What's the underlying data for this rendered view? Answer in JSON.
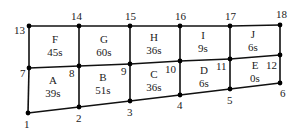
{
  "diagram": {
    "type": "mesh",
    "nodes": [
      {
        "id": "1",
        "x": 28,
        "y": 113,
        "lx": 24,
        "ly": 128
      },
      {
        "id": "2",
        "x": 79,
        "y": 107,
        "lx": 76,
        "ly": 122
      },
      {
        "id": "3",
        "x": 130,
        "y": 101,
        "lx": 127,
        "ly": 116
      },
      {
        "id": "4",
        "x": 180,
        "y": 95,
        "lx": 177,
        "ly": 109
      },
      {
        "id": "5",
        "x": 230,
        "y": 89,
        "lx": 227,
        "ly": 104
      },
      {
        "id": "6",
        "x": 280,
        "y": 83,
        "lx": 280,
        "ly": 97
      },
      {
        "id": "7",
        "x": 29,
        "y": 68,
        "lx": 20,
        "ly": 77
      },
      {
        "id": "8",
        "x": 79,
        "y": 66,
        "lx": 69,
        "ly": 77
      },
      {
        "id": "9",
        "x": 130,
        "y": 64,
        "lx": 121,
        "ly": 75
      },
      {
        "id": "10",
        "x": 180,
        "y": 61,
        "lx": 165,
        "ly": 73
      },
      {
        "id": "11",
        "x": 230,
        "y": 59,
        "lx": 216,
        "ly": 70
      },
      {
        "id": "12",
        "x": 280,
        "y": 55,
        "lx": 266,
        "ly": 69
      },
      {
        "id": "13",
        "x": 29,
        "y": 26,
        "lx": 14,
        "ly": 34
      },
      {
        "id": "14",
        "x": 79,
        "y": 26,
        "lx": 71,
        "ly": 20
      },
      {
        "id": "15",
        "x": 130,
        "y": 26,
        "lx": 125,
        "ly": 20
      },
      {
        "id": "16",
        "x": 180,
        "y": 26,
        "lx": 175,
        "ly": 20
      },
      {
        "id": "17",
        "x": 230,
        "y": 26,
        "lx": 225,
        "ly": 20
      },
      {
        "id": "18",
        "x": 280,
        "y": 25,
        "lx": 276,
        "ly": 18
      }
    ],
    "regions": [
      {
        "name": "A",
        "value": "39s",
        "cx": 53,
        "cy": 86
      },
      {
        "name": "B",
        "value": "51s",
        "cx": 103,
        "cy": 83
      },
      {
        "name": "C",
        "value": "36s",
        "cx": 154,
        "cy": 80
      },
      {
        "name": "D",
        "value": "6s",
        "cx": 204,
        "cy": 76
      },
      {
        "name": "E",
        "value": "0s",
        "cx": 255,
        "cy": 71
      },
      {
        "name": "F",
        "value": "45s",
        "cx": 55,
        "cy": 45
      },
      {
        "name": "G",
        "value": "60s",
        "cx": 104,
        "cy": 45
      },
      {
        "name": "H",
        "value": "36s",
        "cx": 154,
        "cy": 43
      },
      {
        "name": "I",
        "value": "9s",
        "cx": 203,
        "cy": 41
      },
      {
        "name": "J",
        "value": "6s",
        "cx": 253,
        "cy": 40
      }
    ],
    "edges": [
      [
        "1",
        "2"
      ],
      [
        "2",
        "3"
      ],
      [
        "3",
        "4"
      ],
      [
        "4",
        "5"
      ],
      [
        "5",
        "6"
      ],
      [
        "7",
        "8"
      ],
      [
        "8",
        "9"
      ],
      [
        "9",
        "10"
      ],
      [
        "10",
        "11"
      ],
      [
        "11",
        "12"
      ],
      [
        "13",
        "14"
      ],
      [
        "14",
        "15"
      ],
      [
        "15",
        "16"
      ],
      [
        "16",
        "17"
      ],
      [
        "17",
        "18"
      ],
      [
        "1",
        "7"
      ],
      [
        "7",
        "13"
      ],
      [
        "2",
        "8"
      ],
      [
        "8",
        "14"
      ],
      [
        "3",
        "9"
      ],
      [
        "9",
        "15"
      ],
      [
        "4",
        "10"
      ],
      [
        "10",
        "16"
      ],
      [
        "5",
        "11"
      ],
      [
        "11",
        "17"
      ],
      [
        "6",
        "12"
      ],
      [
        "12",
        "18"
      ]
    ]
  }
}
